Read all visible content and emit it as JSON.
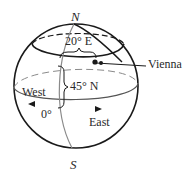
{
  "diagram": {
    "labels": {
      "north_pole": "N",
      "south_pole": "S",
      "longitude": "20° E",
      "latitude": "45° N",
      "city": "Vienna",
      "prime_meridian": "0°",
      "west": "West",
      "east": "East"
    },
    "colors": {
      "outline": "#1a1a1a",
      "meridian": "#8a8a8a",
      "dashed": "#8a8a8a",
      "text": "#2a2a2a"
    }
  }
}
